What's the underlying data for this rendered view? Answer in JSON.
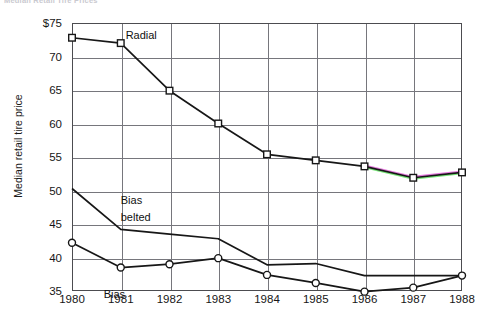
{
  "chart_data": {
    "type": "line",
    "title": "Median Retail Tire Prices",
    "xlabel": "",
    "ylabel": "Median retail tire price",
    "x": [
      1980,
      1981,
      1982,
      1983,
      1984,
      1985,
      1986,
      1987,
      1988
    ],
    "xtick_labels": [
      "1980",
      "1981",
      "1982",
      "1983",
      "1984",
      "1985",
      "1986",
      "1987",
      "1988"
    ],
    "ytick_labels": [
      "$75",
      "70",
      "65",
      "60",
      "55",
      "50",
      "45",
      "40",
      "35"
    ],
    "ytick_values": [
      75,
      70,
      65,
      60,
      55,
      50,
      45,
      40,
      35
    ],
    "ylim": [
      35,
      75
    ],
    "xlim": [
      1980,
      1988
    ],
    "grid": "both",
    "legend": "inline-annotations",
    "series": [
      {
        "name": "Radial",
        "marker": "square",
        "values": [
          72.8,
          72.0,
          64.9,
          60.0,
          55.4,
          54.5,
          53.6,
          51.9,
          52.7
        ]
      },
      {
        "name": "Bias belted",
        "marker": "none",
        "values": [
          50.3,
          44.2,
          43.5,
          42.8,
          38.9,
          39.1,
          37.3,
          37.3,
          37.3
        ]
      },
      {
        "name": "Bias",
        "marker": "circle",
        "values": [
          42.2,
          38.5,
          39.0,
          39.9,
          37.4,
          36.2,
          34.9,
          35.5,
          37.3
        ]
      }
    ],
    "annotations": [
      {
        "text": "Radial",
        "x": 1981.1,
        "y": 73.2
      },
      {
        "text": "Bias",
        "x": 1981.0,
        "y": 48.6
      },
      {
        "text": "belted",
        "x": 1981.0,
        "y": 46.0
      },
      {
        "text": "Bias",
        "x": 1980.65,
        "y": 34.6
      }
    ],
    "colors": {
      "line": "#171717",
      "marker_fill": "#ffffff",
      "grid": "#76767c",
      "frame": "#4c4c50",
      "background": "#ffffff",
      "text": "#161616"
    }
  }
}
